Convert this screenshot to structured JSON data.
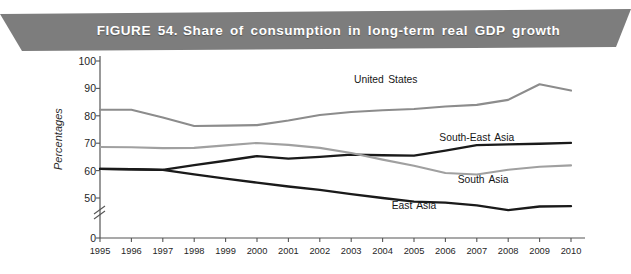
{
  "figure": {
    "label": "FIGURE 54.",
    "title": "Share of consumption in long-term real GDP growth",
    "banner_color": "#7d7d7d",
    "banner_text_color": "#ffffff"
  },
  "chart_data": {
    "type": "line",
    "title": "Share of consumption in long-term real GDP growth",
    "xlabel": "",
    "ylabel": "Percentages",
    "xlim": [
      1995,
      2010
    ],
    "ylim": [
      45,
      100
    ],
    "ytick_labels": [
      "100",
      "90",
      "80",
      "70",
      "60",
      "50",
      "0"
    ],
    "ytick_values": [
      100,
      90,
      80,
      70,
      60,
      50,
      0
    ],
    "axis_break": true,
    "axis_break_between": [
      50,
      0
    ],
    "grid": false,
    "legend": "inline-labels",
    "x": [
      1995,
      1996,
      1997,
      1998,
      1999,
      2000,
      2001,
      2002,
      2003,
      2004,
      2005,
      2006,
      2007,
      2008,
      2009,
      2010
    ],
    "categories": [
      "1995",
      "1996",
      "1997",
      "1998",
      "1999",
      "2000",
      "2001",
      "2002",
      "2003",
      "2004",
      "2005",
      "2006",
      "2007",
      "2008",
      "2009",
      "2010"
    ],
    "series": [
      {
        "name": "United States",
        "color": "#8c8c8c",
        "width": 2.1,
        "label_x": 2004.1,
        "label_y": 93.5,
        "values": [
          82.2,
          82.2,
          79.4,
          76.3,
          76.4,
          76.6,
          78.3,
          80.3,
          81.4,
          82.0,
          82.5,
          83.4,
          84.0,
          85.8,
          91.5,
          89.2
        ]
      },
      {
        "name": "South-East Asia",
        "color": "#1a1a1a",
        "width": 2.3,
        "label_x": 2007.0,
        "label_y": 72.3,
        "values": [
          60.6,
          60.5,
          60.3,
          62.0,
          63.6,
          65.3,
          64.4,
          65.0,
          65.8,
          65.6,
          65.5,
          67.3,
          69.3,
          69.6,
          69.8,
          70.1
        ]
      },
      {
        "name": "South Asia",
        "color": "#a0a0a0",
        "width": 2.1,
        "label_x": 2007.2,
        "label_y": 56.8,
        "values": [
          68.6,
          68.5,
          68.2,
          68.3,
          69.2,
          70.1,
          69.4,
          68.3,
          66.4,
          64.0,
          61.8,
          59.1,
          58.6,
          60.3,
          61.4,
          61.9
        ]
      },
      {
        "name": "East Asia",
        "color": "#1a1a1a",
        "width": 2.3,
        "label_x": 2005.0,
        "label_y": 47.5,
        "values": [
          60.6,
          60.5,
          60.3,
          58.6,
          57.1,
          55.6,
          54.2,
          53.0,
          51.4,
          50.0,
          48.7,
          48.3,
          47.3,
          45.6,
          46.9,
          47.0
        ]
      }
    ]
  }
}
